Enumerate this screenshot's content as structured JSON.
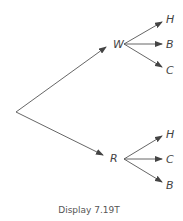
{
  "diagram": {
    "type": "tree",
    "root": {
      "x": 16,
      "y": 112
    },
    "level1": [
      {
        "label": "W",
        "label_pos": {
          "x": 113,
          "y": 48
        },
        "origin": {
          "x": 124,
          "y": 44
        },
        "arrow_to": {
          "x": 106,
          "y": 47
        },
        "children": [
          {
            "label": "H",
            "tip": {
              "x": 162,
              "y": 22
            },
            "label_pos": {
              "x": 166,
              "y": 23
            }
          },
          {
            "label": "B",
            "tip": {
              "x": 162,
              "y": 44
            },
            "label_pos": {
              "x": 166,
              "y": 48
            }
          },
          {
            "label": "C",
            "tip": {
              "x": 162,
              "y": 67
            },
            "label_pos": {
              "x": 166,
              "y": 74
            }
          }
        ]
      },
      {
        "label": "R",
        "label_pos": {
          "x": 110,
          "y": 162
        },
        "origin": {
          "x": 124,
          "y": 159
        },
        "arrow_to": {
          "x": 103,
          "y": 155
        },
        "children": [
          {
            "label": "H",
            "tip": {
              "x": 162,
              "y": 136
            },
            "label_pos": {
              "x": 166,
              "y": 138
            }
          },
          {
            "label": "C",
            "tip": {
              "x": 162,
              "y": 159
            },
            "label_pos": {
              "x": 166,
              "y": 163
            }
          },
          {
            "label": "B",
            "tip": {
              "x": 162,
              "y": 182
            },
            "label_pos": {
              "x": 166,
              "y": 189
            }
          }
        ]
      }
    ]
  },
  "caption": "Display 7.19T",
  "colors": {
    "line": "#555555",
    "text": "#444444"
  }
}
